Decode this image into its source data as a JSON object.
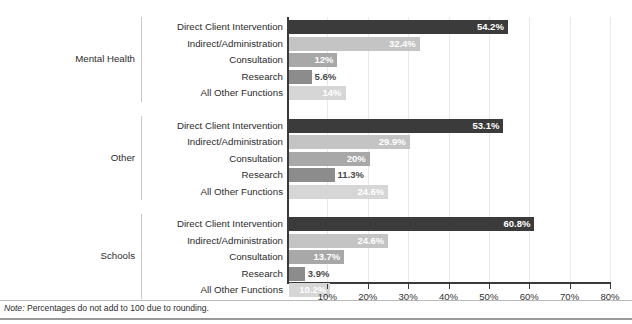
{
  "chart_data": {
    "type": "bar",
    "orientation": "horizontal",
    "title": "",
    "xlabel": "",
    "ylabel": "",
    "xlim": [
      0,
      80
    ],
    "xticks": [
      "10%",
      "20%",
      "30%",
      "40%",
      "50%",
      "60%",
      "70%",
      "80%"
    ],
    "xtick_values": [
      10,
      20,
      30,
      40,
      50,
      60,
      70,
      80
    ],
    "grid": true,
    "legend": "none",
    "categories": [
      "Direct Client Intervention",
      "Indirect/Administration",
      "Consultation",
      "Research",
      "All Other Functions"
    ],
    "series": [
      {
        "name": "Mental Health",
        "values": [
          54.2,
          32.4,
          12.0,
          5.6,
          14.0
        ],
        "labels": [
          "54.2%",
          "32.4%",
          "12%",
          "5.6%",
          "14%"
        ]
      },
      {
        "name": "Other",
        "values": [
          53.1,
          29.9,
          20.0,
          11.3,
          24.6
        ],
        "labels": [
          "53.1%",
          "29.9%",
          "20%",
          "11.3%",
          "24.6%"
        ]
      },
      {
        "name": "Schools",
        "values": [
          60.8,
          24.6,
          13.7,
          3.9,
          10.2
        ],
        "labels": [
          "60.8%",
          "24.6%",
          "13.7%",
          "3.9%",
          "10.2%"
        ]
      }
    ],
    "bar_colors": [
      "#3b3b3b",
      "#c4c4c4",
      "#a8a8a8",
      "#8c8c8c",
      "#d6d6d6"
    ],
    "note": "Note: Percentages do not add to 100 due to rounding.",
    "note_prefix": "Note:",
    "note_body": " Percentages do not add to 100 due to rounding."
  },
  "groups": [
    {
      "name": "Mental Health",
      "rows": [
        {
          "label": "Direct Client Intervention",
          "value": 54.2,
          "display": "54.2%",
          "color": "#3b3b3b",
          "label_inside": true
        },
        {
          "label": "Indirect/Administration",
          "value": 32.4,
          "display": "32.4%",
          "color": "#c4c4c4",
          "label_inside": true
        },
        {
          "label": "Consultation",
          "value": 12.0,
          "display": "12%",
          "color": "#a8a8a8",
          "label_inside": true
        },
        {
          "label": "Research",
          "value": 5.6,
          "display": "5.6%",
          "color": "#8c8c8c",
          "label_inside": false
        },
        {
          "label": "All Other Functions",
          "value": 14.0,
          "display": "14%",
          "color": "#d6d6d6",
          "label_inside": true
        }
      ]
    },
    {
      "name": "Other",
      "rows": [
        {
          "label": "Direct Client Intervention",
          "value": 53.1,
          "display": "53.1%",
          "color": "#3b3b3b",
          "label_inside": true
        },
        {
          "label": "Indirect/Administration",
          "value": 29.9,
          "display": "29.9%",
          "color": "#c4c4c4",
          "label_inside": true
        },
        {
          "label": "Consultation",
          "value": 20.0,
          "display": "20%",
          "color": "#a8a8a8",
          "label_inside": true
        },
        {
          "label": "Research",
          "value": 11.3,
          "display": "11.3%",
          "color": "#8c8c8c",
          "label_inside": false
        },
        {
          "label": "All Other Functions",
          "value": 24.6,
          "display": "24.6%",
          "color": "#d6d6d6",
          "label_inside": true
        }
      ]
    },
    {
      "name": "Schools",
      "rows": [
        {
          "label": "Direct Client Intervention",
          "value": 60.8,
          "display": "60.8%",
          "color": "#3b3b3b",
          "label_inside": true
        },
        {
          "label": "Indirect/Administration",
          "value": 24.6,
          "display": "24.6%",
          "color": "#c4c4c4",
          "label_inside": true
        },
        {
          "label": "Consultation",
          "value": 13.7,
          "display": "13.7%",
          "color": "#a8a8a8",
          "label_inside": true
        },
        {
          "label": "Research",
          "value": 3.9,
          "display": "3.9%",
          "color": "#8c8c8c",
          "label_inside": false
        },
        {
          "label": "All Other Functions",
          "value": 10.2,
          "display": "10.2%",
          "color": "#d6d6d6",
          "label_inside": true
        }
      ]
    }
  ],
  "axis": {
    "ticks": [
      "10%",
      "20%",
      "30%",
      "40%",
      "50%",
      "60%",
      "70%",
      "80%"
    ]
  },
  "footnote": {
    "prefix": "Note:",
    "body": " Percentages do not add to 100 due to rounding."
  },
  "colors": {
    "axis": "#3a3a3a",
    "grid": "#e9e9e9",
    "separator": "#c9c9c9",
    "text": "#2b2b2b",
    "label_light": "#ffffff",
    "label_dark": "#4a4a4a"
  }
}
